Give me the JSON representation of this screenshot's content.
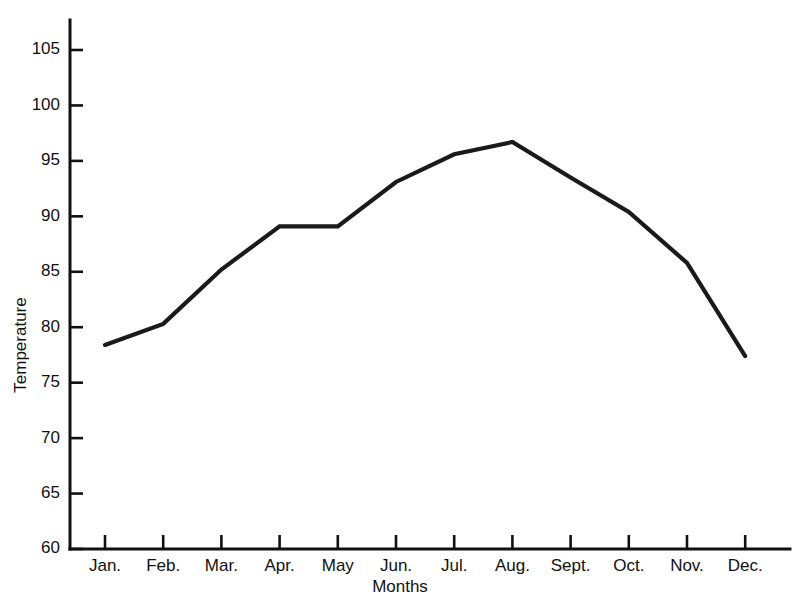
{
  "chart_data": {
    "type": "line",
    "title": "",
    "xlabel": "Months",
    "ylabel": "Temperature",
    "categories": [
      "Jan.",
      "Feb.",
      "Mar.",
      "Apr.",
      "May",
      "Jun.",
      "Jul.",
      "Aug.",
      "Sept.",
      "Oct.",
      "Nov.",
      "Dec."
    ],
    "values": [
      78.4,
      80.3,
      85.2,
      89.1,
      89.1,
      93.1,
      95.6,
      96.7,
      93.5,
      90.4,
      85.8,
      77.4
    ],
    "series": [
      {
        "name": "Temperature",
        "values": [
          78.4,
          80.3,
          85.2,
          89.1,
          89.1,
          93.1,
          95.6,
          96.7,
          93.5,
          90.4,
          85.8,
          77.4
        ]
      }
    ],
    "ylim": [
      60,
      105
    ],
    "y_ticks": [
      60,
      65,
      70,
      75,
      80,
      85,
      90,
      95,
      100,
      105
    ],
    "y_tick_labels": [
      "60",
      "65",
      "70",
      "75",
      "80",
      "85",
      "90",
      "95",
      "100",
      "105"
    ],
    "x_tick_labels": [
      "Jan.",
      "Feb.",
      "Mar.",
      "Apr.",
      "May",
      "Jun.",
      "Jul.",
      "Aug.",
      "Sept.",
      "Oct.",
      "Nov.",
      "Dec."
    ],
    "grid": false,
    "legend": false,
    "legend_position": "none",
    "line_color": "#1a1a1a",
    "axis_color": "#111111",
    "background_color": "#ffffff"
  },
  "axis": {
    "y_title": "Temperature",
    "x_title": "Months"
  }
}
